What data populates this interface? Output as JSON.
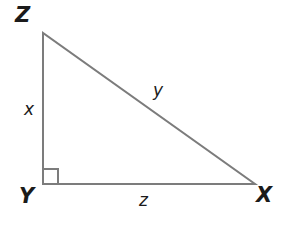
{
  "figure": {
    "kind": "right-triangle-diagram",
    "background_color": "#ffffff",
    "stroke_color": "#7c7c7c",
    "label_color": "#1b1b1b",
    "stroke_width": 2,
    "vertices": [
      {
        "name": "Z",
        "label": "Z",
        "x": 43,
        "y": 33
      },
      {
        "name": "Y",
        "label": "Y",
        "x": 43,
        "y": 184
      },
      {
        "name": "X",
        "label": "X",
        "x": 255,
        "y": 184
      }
    ],
    "sides": [
      {
        "name": "ZY",
        "label": "x",
        "role": "vertical-leg"
      },
      {
        "name": "ZX",
        "label": "y",
        "role": "hypotenuse"
      },
      {
        "name": "YX",
        "label": "z",
        "role": "horizontal-leg"
      }
    ],
    "right_angle": {
      "at_vertex": "Y",
      "marker": "square",
      "size": 15
    }
  }
}
